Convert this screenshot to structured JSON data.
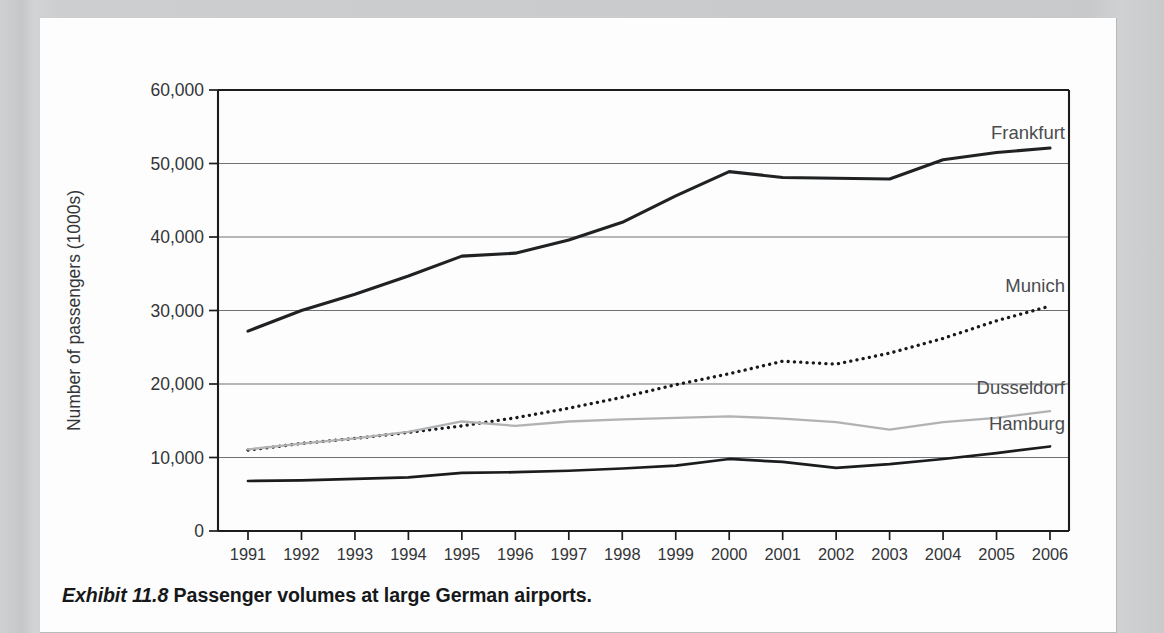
{
  "caption": {
    "exhibit_label": "Exhibit 11.8",
    "text": "Passenger volumes at large German airports."
  },
  "chart_data": {
    "type": "line",
    "title": "",
    "xlabel": "Year",
    "ylabel": "Number of passengers (1000s)",
    "categories": [
      1991,
      1992,
      1993,
      1994,
      1995,
      1996,
      1997,
      1998,
      1999,
      2000,
      2001,
      2002,
      2003,
      2004,
      2005,
      2006
    ],
    "xtick_labels": [
      "1991",
      "1992",
      "1993",
      "1994",
      "1995",
      "1996",
      "1997",
      "1998",
      "1999",
      "2000",
      "2001",
      "2002",
      "2003",
      "2004",
      "2005",
      "2006"
    ],
    "ytick_labels": [
      "0",
      "10,000",
      "20,000",
      "30,000",
      "40,000",
      "50,000",
      "60,000"
    ],
    "ytick_values": [
      0,
      10000,
      20000,
      30000,
      40000,
      50000,
      60000
    ],
    "ylim": [
      0,
      60000
    ],
    "grid": "horizontal",
    "legend_position": "right-inline-labels",
    "series": [
      {
        "name": "Frankfurt",
        "style": "solid-thick-dark",
        "color": "#1f2123",
        "width": 3.1,
        "values": [
          27200,
          30000,
          32200,
          34700,
          37400,
          37800,
          39600,
          42000,
          45600,
          48900,
          48100,
          48000,
          47900,
          50500,
          51500,
          52100
        ]
      },
      {
        "name": "Munich",
        "style": "dotted-dark",
        "color": "#17191b",
        "width": 3.3,
        "values": [
          11000,
          11900,
          12600,
          13400,
          14300,
          15400,
          16700,
          18200,
          19900,
          21400,
          23100,
          22700,
          24200,
          26200,
          28600,
          30600
        ]
      },
      {
        "name": "Dusseldorf",
        "style": "solid-thin-gray",
        "color": "#b0b2b4",
        "width": 2.3,
        "values": [
          11100,
          11900,
          12600,
          13500,
          14900,
          14300,
          14900,
          15200,
          15400,
          15600,
          15300,
          14800,
          13800,
          14800,
          15400,
          16300
        ]
      },
      {
        "name": "Hamburg",
        "style": "solid-thin-dark",
        "color": "#1a1c1e",
        "width": 2.7,
        "values": [
          6800,
          6900,
          7100,
          7300,
          7900,
          8000,
          8200,
          8500,
          8900,
          9800,
          9400,
          8600,
          9100,
          9800,
          10600,
          11500
        ]
      }
    ],
    "series_label_anchors": [
      {
        "name": "Frankfurt",
        "value": 53300
      },
      {
        "name": "Munich",
        "value": 32500
      },
      {
        "name": "Dusseldorf",
        "value": 18600
      },
      {
        "name": "Hamburg",
        "value": 13700
      }
    ]
  }
}
